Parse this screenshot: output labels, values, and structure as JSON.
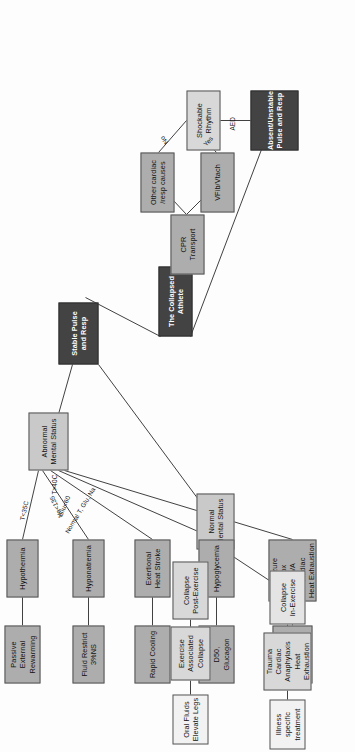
{
  "diagram": {
    "title": "The Collapsed Athlete",
    "orientation": "rotated-90",
    "colors": {
      "root_fill": "#434343",
      "root_text": "#ffffff",
      "branch_fill": "#434343",
      "node_fill": "#b6b6b6",
      "node_light_fill": "#d8d8d8",
      "node_pale_fill": "#e4e4e4",
      "edge_stroke": "#2b2b2b"
    }
  },
  "nodes": {
    "root": "The Collapsed Athlete",
    "stable": "Stable Pulse\nand Resp",
    "absent": "Absent/Unstable\nPulse and Resp",
    "abnormal_mental": "Abnormal\nMental Status",
    "normal_mental": "Normal\nMental Status",
    "hypothermia": "Hypothermia",
    "passive_rewarming": "Passive\nExternal\nRewarming",
    "hyponatremia": "Hyponatremia",
    "fluid_restrict": "Fluid Restrict\n3%NS",
    "heat_stroke": "Exertional\nHeat Stroke",
    "rapid_cooling": "Rapid Cooling",
    "hypoglycemia": "Hypoglycemia",
    "administer_d50": "Administer\nD50,\nGlucagon",
    "seizure_group": "Seizure\nTox\nCVA\nCardiac\nHeat Exhaustion",
    "illness_specific_1": "Illness\nspecific\ntreatment",
    "collapse_post": "Collapse\nPost-Exercise",
    "exercise_assoc": "Exercise\nAssociated\nCollapse",
    "oral_fluids": "Oral Fluids\nElevate Legs",
    "collapse_in": "Collapse\nIn-Exercise",
    "trauma_group": "Trauma\nCardiac\nAnaphylaxis\nHeat Exhaustion",
    "illness_specific_2": "Illness specific\ntreatment",
    "shockable": "Shockable\nRhythm",
    "other_causes": "Other cardiac\n/resp causes",
    "vfib": "VFib/Vtach",
    "cpr_transport": "CPR\nTransport"
  },
  "edge_labels": {
    "t_lt_35": "T<35C",
    "na_lt_135": "Na<135",
    "t_gt_40": "T>40C",
    "glu_lt_60": "Glu<60",
    "normal_labs": "Normal T, Glu, Na",
    "aed": "AED",
    "no": "No",
    "yes": "Yes"
  }
}
